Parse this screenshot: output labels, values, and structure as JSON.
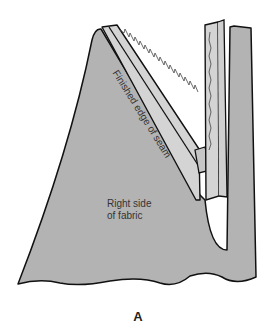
{
  "figure": {
    "caption": "A",
    "labels": {
      "seam_edge": "Finished edge of seam",
      "fabric_line1": "Right side",
      "fabric_line2": "of fabric"
    },
    "colors": {
      "fabric": "#b3b3b3",
      "seam_allowance": "#d4d4d4",
      "outline": "#111111"
    }
  }
}
